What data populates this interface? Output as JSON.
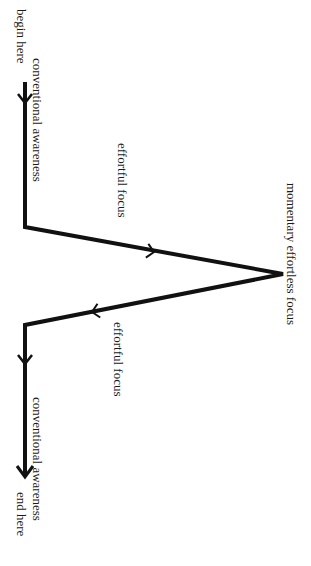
{
  "diagram": {
    "title": "",
    "orientation": "rotated-90-clockwise",
    "labels": {
      "begin": "begin here",
      "conventional_top": "conventional awareness",
      "effortful_up": "effortful focus",
      "peak": "momentary effortless focus",
      "effortful_down": "effortful focus",
      "conventional_bottom": "conventional awareness",
      "end": "end here"
    },
    "path": {
      "stroke_color": "#111111",
      "points": [
        {
          "name": "start",
          "x": 25,
          "y": 82
        },
        {
          "name": "corner-1",
          "x": 25,
          "y": 227
        },
        {
          "name": "apex",
          "x": 283,
          "y": 274
        },
        {
          "name": "corner-2",
          "x": 25,
          "y": 325
        },
        {
          "name": "end",
          "x": 25,
          "y": 476
        }
      ],
      "arrows": [
        {
          "name": "start-arrow",
          "x": 25,
          "y": 102,
          "direction": "down"
        },
        {
          "name": "ascent-arrow",
          "x": 153,
          "y": 251,
          "direction": "toward-apex"
        },
        {
          "name": "descent-arrow",
          "x": 93,
          "y": 312,
          "direction": "away-from-apex"
        },
        {
          "name": "mid-arrow",
          "x": 25,
          "y": 362,
          "direction": "down"
        },
        {
          "name": "end-arrow",
          "x": 25,
          "y": 476,
          "direction": "down"
        }
      ]
    }
  }
}
